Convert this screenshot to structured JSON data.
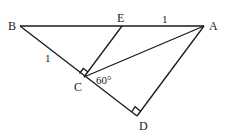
{
  "figure": {
    "type": "geometry-diagram",
    "points": {
      "B": {
        "label": "B",
        "x": 20,
        "y": 26
      },
      "E": {
        "label": "E",
        "x": 122,
        "y": 26
      },
      "A": {
        "label": "A",
        "x": 204,
        "y": 26
      },
      "C": {
        "label": "C",
        "x": 84,
        "y": 77
      },
      "D": {
        "label": "D",
        "x": 137,
        "y": 116
      }
    },
    "segments": [
      "BA",
      "BD",
      "EC",
      "CA",
      "AD"
    ],
    "right_angles": [
      "C (between CB and CE)",
      "D (between DC and DA)"
    ],
    "annotations": {
      "ea_length": "1",
      "bc_length": "1",
      "angle_acd": "60°"
    },
    "colors": {
      "stroke": "#1a1a1a",
      "background": "#ffffff"
    }
  }
}
